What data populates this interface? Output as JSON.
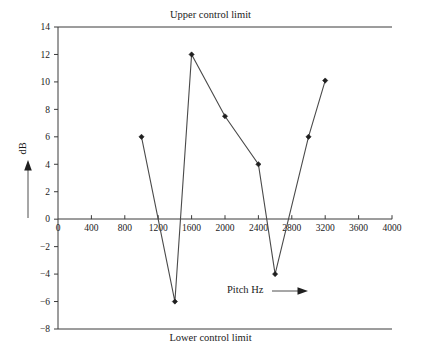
{
  "chart_data": {
    "type": "line",
    "title": "",
    "xlabel": "Pitch Hz",
    "ylabel": "dB",
    "xlim": [
      0,
      4000
    ],
    "ylim": [
      -8,
      14
    ],
    "grid": false,
    "legend": null,
    "x": [
      1000,
      1400,
      1600,
      2000,
      2400,
      2600,
      3000,
      3200
    ],
    "values": [
      6,
      -6,
      12,
      7.5,
      4,
      -4,
      6,
      10.1
    ],
    "series": [
      {
        "name": "Measurement",
        "x": [
          1000,
          1400,
          1600,
          2000,
          2400,
          2600,
          3000,
          3200
        ],
        "values": [
          6,
          -6,
          12,
          7.5,
          4,
          -4,
          6,
          10.1
        ]
      }
    ],
    "xticks": [
      0,
      400,
      800,
      1200,
      1600,
      2000,
      2400,
      2800,
      3200,
      3600,
      4000
    ],
    "xtick_labels": [
      "0",
      "400",
      "800",
      "1200",
      "1600",
      "2000",
      "2400",
      "2800",
      "3200",
      "3600",
      "4000"
    ],
    "yticks": [
      14,
      12,
      10,
      8,
      6,
      4,
      2,
      0,
      -2,
      -4,
      -6,
      -8
    ],
    "ytick_labels": [
      "14",
      "12",
      "10",
      "8",
      "6",
      "4",
      "2",
      "0",
      "−2",
      "−4",
      "−6",
      "−8"
    ],
    "annotations": {
      "upper_control_limit": "Upper control limit",
      "lower_control_limit": "Lower control limit"
    },
    "colors": {
      "line": "#4a4a4a",
      "marker": "#1f1f1f",
      "axis": "#3a3a3a",
      "text": "#1a1a1a",
      "background": "#ffffff"
    }
  },
  "labels": {
    "upper_control_limit": "Upper control limit",
    "lower_control_limit": "Lower control limit",
    "pitch_axis": "Pitch Hz",
    "db_axis": "dB"
  }
}
